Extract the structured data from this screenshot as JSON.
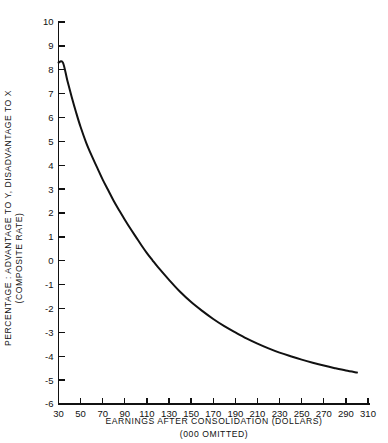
{
  "chart_data": {
    "type": "line",
    "title": "",
    "xlabel_line1": "EARNINGS AFTER CONSOLIDATION (DOLLARS)",
    "xlabel_line2": "(000 OMITTED)",
    "ylabel_line1": "PERCENTAGE : ADVANTAGE TO Y, DISADVANTAGE TO  X",
    "ylabel_line2": "(COMPOSITE RATE)",
    "xlim": [
      30,
      310
    ],
    "ylim": [
      -6,
      10
    ],
    "xticks": [
      30,
      50,
      70,
      90,
      110,
      130,
      150,
      170,
      190,
      210,
      230,
      250,
      270,
      290,
      310
    ],
    "yticks": [
      10,
      9,
      8,
      7,
      6,
      5,
      4,
      3,
      2,
      1,
      0,
      -1,
      -2,
      -3,
      -4,
      -5,
      -6
    ],
    "xtick_labels": [
      "30",
      "50",
      "70",
      "90",
      "110",
      "130",
      "150",
      "170",
      "190",
      "210",
      "230",
      "250",
      "270",
      "290",
      "310"
    ],
    "ytick_labels": [
      "10",
      "9",
      "8",
      "7",
      "6",
      "5",
      "4",
      "3",
      "2",
      "1",
      "0",
      "-1",
      "-2",
      "-3",
      "-4",
      "-5",
      "-6"
    ],
    "grid": false,
    "legend": "none",
    "line_color": "#111111",
    "series": [
      {
        "name": "composite rate differential",
        "x": [
          30,
          34,
          38,
          42,
          46,
          50,
          55,
          60,
          65,
          70,
          75,
          80,
          85,
          90,
          95,
          100,
          105,
          110,
          115,
          120,
          130,
          140,
          150,
          160,
          170,
          180,
          190,
          200,
          210,
          220,
          230,
          240,
          250,
          260,
          270,
          280,
          290,
          300
        ],
        "y": [
          8.3,
          8.3,
          7.55,
          6.85,
          6.2,
          5.6,
          4.95,
          4.4,
          3.9,
          3.4,
          2.95,
          2.5,
          2.1,
          1.72,
          1.35,
          1.0,
          0.65,
          0.32,
          0.02,
          -0.27,
          -0.8,
          -1.3,
          -1.73,
          -2.1,
          -2.44,
          -2.74,
          -3.0,
          -3.25,
          -3.47,
          -3.67,
          -3.85,
          -4.0,
          -4.14,
          -4.27,
          -4.39,
          -4.5,
          -4.6,
          -4.68
        ]
      }
    ]
  }
}
